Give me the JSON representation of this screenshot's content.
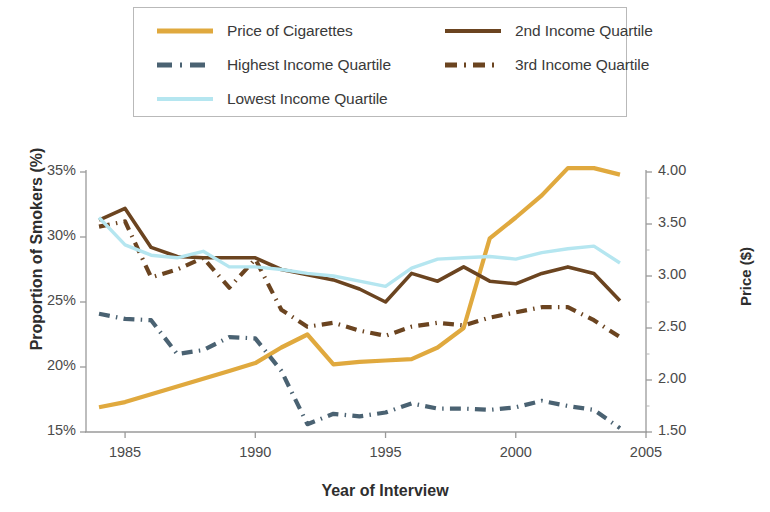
{
  "legend": {
    "entries": [
      {
        "label": "Price of Cigarettes",
        "color": "#e0a93e",
        "style": "solid"
      },
      {
        "label": "2nd Income Quartile",
        "color": "#6b4420",
        "style": "solid"
      },
      {
        "label": "Highest Income Quartile",
        "color": "#4a6272",
        "style": "dashdot"
      },
      {
        "label": "3rd Income Quartile",
        "color": "#6b4420",
        "style": "dashdot"
      },
      {
        "label": "Lowest Income Quartile",
        "color": "#b5e6f0",
        "style": "solid"
      }
    ]
  },
  "axes": {
    "xlabel": "Year of Interview",
    "ylabel_left": "Proportion of Smokers (%)",
    "ylabel_right": "Price ($)",
    "xticks": [
      "1985",
      "1990",
      "1995",
      "2000",
      "2005"
    ],
    "yticks_left": [
      "35%",
      "30%",
      "25%",
      "20%",
      "15%"
    ],
    "yticks_right": [
      "4.00",
      "3.50",
      "3.00",
      "2.50",
      "2.00",
      "1.50"
    ]
  },
  "chart_data": {
    "type": "line",
    "title": "",
    "xlabel": "Year of Interview",
    "ylabel": "Proportion of Smokers (%)",
    "ylabel_secondary": "Price ($)",
    "xlim": [
      1983.5,
      2005.0
    ],
    "ylim": [
      15,
      35
    ],
    "ylim_secondary": [
      1.5,
      4.0
    ],
    "grid": false,
    "legend_position": "top",
    "x": [
      1984,
      1985,
      1986,
      1987,
      1988,
      1989,
      1990,
      1991,
      1992,
      1993,
      1994,
      1995,
      1996,
      1997,
      1998,
      1999,
      2000,
      2001,
      2002,
      2003,
      2004
    ],
    "series": [
      {
        "name": "Price of Cigarettes",
        "axis": "secondary",
        "color": "#e0a93e",
        "style": "solid",
        "values": [
          1.73,
          1.79,
          1.87,
          1.95,
          2.02,
          2.1,
          2.17,
          2.33,
          2.4,
          2.18,
          2.2,
          2.2,
          2.22,
          2.32,
          2.5,
          3.19,
          3.39,
          3.6,
          3.99,
          3.99,
          3.96
        ],
        "values_pct_scale": [
          16.9,
          17.3,
          17.9,
          18.5,
          19.1,
          19.7,
          20.3,
          21.5,
          22.5,
          20.2,
          20.4,
          20.5,
          20.6,
          21.5,
          23.0,
          29.9,
          31.5,
          33.2,
          35.3,
          35.3,
          34.8
        ]
      },
      {
        "name": "2nd Income Quartile",
        "axis": "primary",
        "color": "#6b4420",
        "style": "solid",
        "values": [
          31.3,
          32.2,
          29.2,
          28.5,
          28.4,
          28.4,
          28.4,
          27.5,
          27.1,
          26.7,
          26.0,
          25.0,
          27.2,
          26.6,
          27.7,
          26.6,
          26.4,
          27.2,
          27.7,
          27.2,
          25.1
        ]
      },
      {
        "name": "Highest Income Quartile",
        "axis": "primary",
        "color": "#4a6272",
        "style": "dashdot",
        "values": [
          24.1,
          23.7,
          23.6,
          21.0,
          21.3,
          22.3,
          22.2,
          19.7,
          15.6,
          16.4,
          16.2,
          16.5,
          17.2,
          16.8,
          16.8,
          16.7,
          16.9,
          17.4,
          17.0,
          16.7,
          15.3
        ]
      },
      {
        "name": "3rd Income Quartile",
        "axis": "primary",
        "color": "#6b4420",
        "style": "dashdot",
        "values": [
          30.8,
          31.2,
          26.9,
          27.5,
          28.4,
          26.1,
          28.3,
          24.4,
          23.1,
          23.4,
          22.8,
          22.4,
          23.1,
          23.4,
          23.2,
          23.8,
          24.2,
          24.6,
          24.6,
          23.6,
          22.3
        ]
      },
      {
        "name": "Lowest Income Quartile",
        "axis": "primary",
        "color": "#b5e6f0",
        "style": "solid",
        "values": [
          31.5,
          29.4,
          28.6,
          28.4,
          28.9,
          27.7,
          27.7,
          27.5,
          27.2,
          27.0,
          26.6,
          26.2,
          27.6,
          28.3,
          28.4,
          28.5,
          28.3,
          28.8,
          29.1,
          29.3,
          28.0
        ]
      }
    ]
  }
}
